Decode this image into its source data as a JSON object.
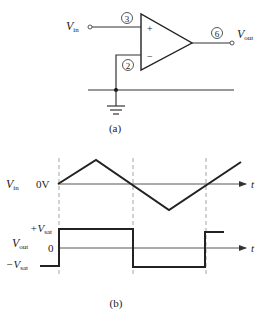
{
  "figure_a": {
    "caption": "(a)",
    "input_label": "V",
    "input_sub": "in",
    "output_label": "V",
    "output_sub": "out",
    "pins": {
      "noninverting": "3",
      "inverting": "2",
      "output": "6"
    },
    "plus_sign": "+",
    "minus_sign": "−"
  },
  "figure_b": {
    "caption": "(b)",
    "vin_label": "V",
    "vin_sub": "in",
    "vin_zero": "0V",
    "vout_label": "V",
    "vout_sub": "out",
    "vout_zero": "0",
    "pos_sat_prefix": "+V",
    "pos_sat_sub": "sat",
    "neg_sat_prefix": "−V",
    "neg_sat_sub": "sat",
    "time_axis_label": "t",
    "time_axis_label_2": "t"
  },
  "waveforms": {
    "vin_points": "58,184 96,160 169,210 241,162",
    "vout_points": "40,266 59,266 59,229 133,229 133,267 205,267 205,232 224,232"
  }
}
